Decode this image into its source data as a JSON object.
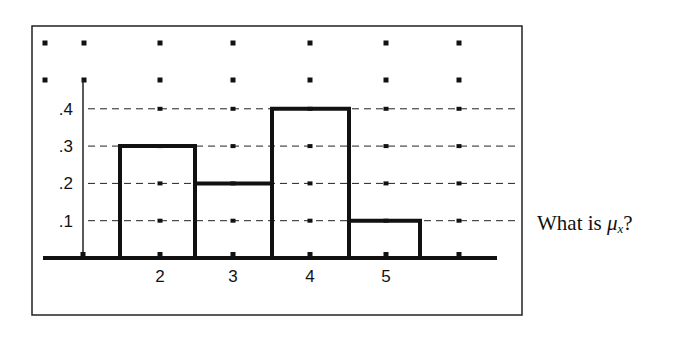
{
  "chart_data": {
    "type": "bar",
    "title": "",
    "xlabel": "",
    "ylabel": "",
    "categories": [
      "1",
      "2",
      "3",
      "4",
      "5"
    ],
    "values": [
      0,
      0.3,
      0.2,
      0.4,
      0.1
    ],
    "bars": [
      {
        "x": 2,
        "height": 0.3
      },
      {
        "x": 3,
        "height": 0.2
      },
      {
        "x": 4,
        "height": 0.4
      },
      {
        "x": 5,
        "height": 0.1
      }
    ],
    "x_tick_labels": [
      "2",
      "3",
      "4",
      "5"
    ],
    "y_tick_labels": [
      ".1",
      ".2",
      ".3",
      ".4"
    ],
    "y_ticks": [
      0.1,
      0.2,
      0.3,
      0.4
    ],
    "ylim": [
      0,
      0.6
    ],
    "grid": "horizontal dashed at y ticks plus dot grid",
    "legend": "none"
  },
  "geometry": {
    "frame": {
      "x": 32,
      "y": 26,
      "w": 490,
      "h": 289
    },
    "baseline_y": 258,
    "baseline_x": [
      43,
      497
    ],
    "y_axis_x": 83,
    "y_axis_top": 80,
    "px_per_unit": 373,
    "dot_cols": [
      45,
      84,
      160,
      233,
      310,
      386,
      459
    ],
    "dot_rows": [
      43,
      80
    ],
    "bar_edges": [
      120,
      195,
      272,
      349,
      420
    ],
    "x_label_pos": [
      160,
      233,
      310,
      386
    ],
    "grid_right": 520
  },
  "question": {
    "prefix": "What is ",
    "symbol": "μ",
    "subscript": "x",
    "suffix": "?"
  }
}
